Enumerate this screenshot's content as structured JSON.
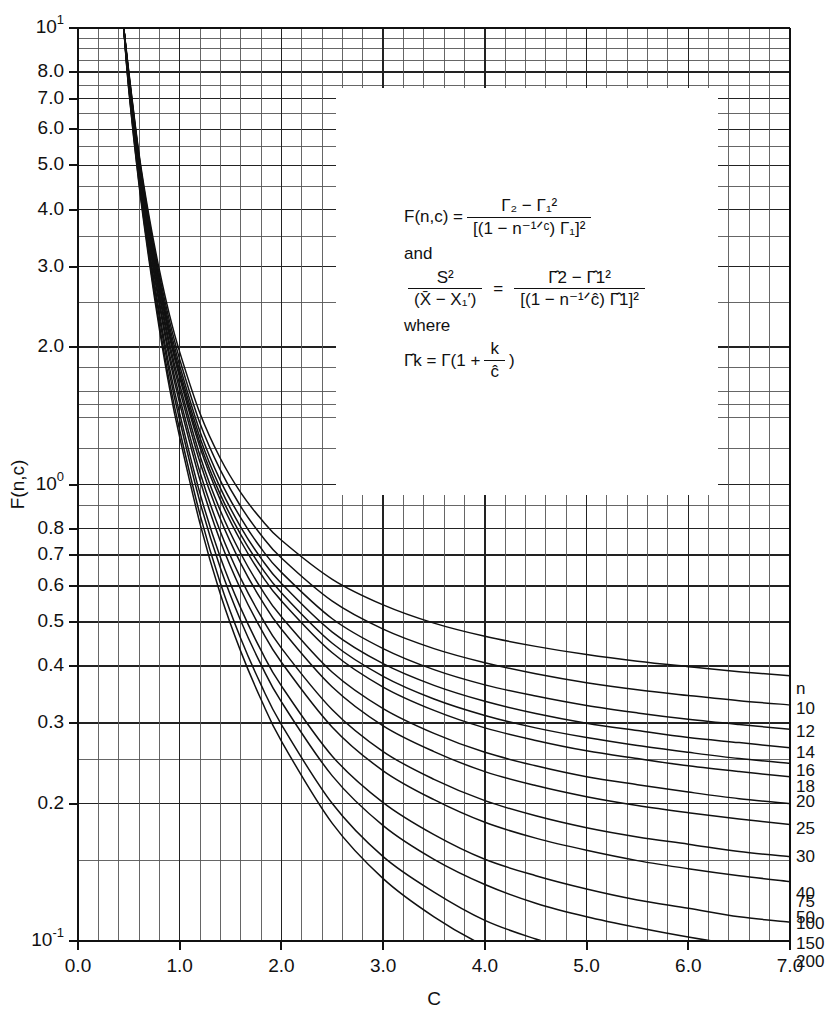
{
  "chart_data": {
    "type": "line",
    "title": "",
    "xlabel": "C",
    "ylabel": "F(n,c)",
    "xlim": [
      0.0,
      7.0
    ],
    "ylim": [
      0.1,
      10.0
    ],
    "yscale": "log",
    "xscale": "linear",
    "grid": true,
    "legend_position": "right-edge-labels",
    "xticks": [
      "0.0",
      "1.0",
      "2.0",
      "3.0",
      "4.0",
      "5.0",
      "6.0",
      "7.0"
    ],
    "xtick_values": [
      0,
      1,
      2,
      3,
      4,
      5,
      6,
      7
    ],
    "yticks": [
      "10¹",
      "8.0",
      "7.0",
      "6.0",
      "5.0",
      "4.0",
      "3.0",
      "2.0",
      "10⁰",
      "0.8",
      "0.7",
      "0.6",
      "0.5",
      "0.4",
      "0.3",
      "0.2",
      "10⁻¹"
    ],
    "ytick_values": [
      10,
      8,
      7,
      6,
      5,
      4,
      3,
      2,
      1,
      0.8,
      0.7,
      0.6,
      0.5,
      0.4,
      0.3,
      0.2,
      0.1
    ],
    "series_header": "n",
    "series": [
      {
        "name": "10",
        "end_value": 0.375,
        "x": [
          0.45,
          0.5,
          0.6,
          0.7,
          0.8,
          0.9,
          1.0,
          1.2,
          1.4,
          1.6,
          1.8,
          2.0,
          2.5,
          3.0,
          3.5,
          4.0,
          4.5,
          5.0,
          5.5,
          6.0,
          6.5,
          7.0
        ],
        "values": [
          10.0,
          8.0,
          5.3,
          3.85,
          2.95,
          2.35,
          1.95,
          1.43,
          1.14,
          0.96,
          0.84,
          0.755,
          0.62,
          0.545,
          0.497,
          0.465,
          0.442,
          0.424,
          0.41,
          0.399,
          0.389,
          0.381
        ]
      },
      {
        "name": "12",
        "end_value": 0.315,
        "x": [
          0.45,
          0.5,
          0.6,
          0.7,
          0.8,
          0.9,
          1.0,
          1.2,
          1.4,
          1.6,
          1.8,
          2.0,
          2.5,
          3.0,
          3.5,
          4.0,
          4.5,
          5.0,
          5.5,
          6.0,
          6.5,
          7.0
        ],
        "values": [
          10.0,
          7.95,
          5.25,
          3.78,
          2.88,
          2.28,
          1.88,
          1.36,
          1.075,
          0.895,
          0.775,
          0.69,
          0.555,
          0.482,
          0.437,
          0.407,
          0.385,
          0.368,
          0.355,
          0.345,
          0.336,
          0.329
        ]
      },
      {
        "name": "14",
        "end_value": 0.283,
        "x": [
          0.45,
          0.5,
          0.6,
          0.7,
          0.8,
          0.9,
          1.0,
          1.2,
          1.4,
          1.6,
          1.8,
          2.0,
          2.5,
          3.0,
          3.5,
          4.0,
          4.5,
          5.0,
          5.5,
          6.0,
          6.5,
          7.0
        ],
        "values": [
          10.0,
          7.9,
          5.2,
          3.72,
          2.82,
          2.22,
          1.82,
          1.305,
          1.02,
          0.845,
          0.725,
          0.642,
          0.508,
          0.437,
          0.393,
          0.364,
          0.344,
          0.328,
          0.316,
          0.306,
          0.298,
          0.291
        ]
      },
      {
        "name": "16",
        "end_value": 0.262,
        "x": [
          0.45,
          0.5,
          0.6,
          0.7,
          0.8,
          0.9,
          1.0,
          1.2,
          1.4,
          1.6,
          1.8,
          2.0,
          2.5,
          3.0,
          3.5,
          4.0,
          4.5,
          5.0,
          5.5,
          6.0,
          6.5,
          7.0
        ],
        "values": [
          10.0,
          7.86,
          5.16,
          3.68,
          2.77,
          2.17,
          1.775,
          1.265,
          0.982,
          0.807,
          0.689,
          0.607,
          0.475,
          0.405,
          0.363,
          0.335,
          0.315,
          0.3,
          0.289,
          0.279,
          0.272,
          0.265
        ]
      },
      {
        "name": "18",
        "end_value": 0.245,
        "x": [
          0.45,
          0.5,
          0.6,
          0.7,
          0.8,
          0.9,
          1.0,
          1.2,
          1.4,
          1.6,
          1.8,
          2.0,
          2.5,
          3.0,
          3.5,
          4.0,
          4.5,
          5.0,
          5.5,
          6.0,
          6.5,
          7.0
        ],
        "values": [
          10.0,
          7.83,
          5.12,
          3.64,
          2.73,
          2.13,
          1.74,
          1.232,
          0.95,
          0.777,
          0.66,
          0.579,
          0.449,
          0.38,
          0.339,
          0.312,
          0.293,
          0.279,
          0.268,
          0.259,
          0.251,
          0.245
        ]
      },
      {
        "name": "20",
        "end_value": 0.232,
        "x": [
          0.45,
          0.5,
          0.6,
          0.7,
          0.8,
          0.9,
          1.0,
          1.2,
          1.4,
          1.6,
          1.8,
          2.0,
          2.5,
          3.0,
          3.5,
          4.0,
          4.5,
          5.0,
          5.5,
          6.0,
          6.5,
          7.0
        ],
        "values": [
          10.0,
          7.8,
          5.09,
          3.61,
          2.7,
          2.1,
          1.712,
          1.205,
          0.924,
          0.752,
          0.636,
          0.556,
          0.428,
          0.36,
          0.32,
          0.293,
          0.275,
          0.261,
          0.251,
          0.242,
          0.235,
          0.229
        ]
      },
      {
        "name": "25",
        "end_value": 0.205,
        "x": [
          0.45,
          0.5,
          0.6,
          0.7,
          0.8,
          0.9,
          1.0,
          1.2,
          1.4,
          1.6,
          1.8,
          2.0,
          2.5,
          3.0,
          3.5,
          4.0,
          4.5,
          5.0,
          5.5,
          6.0,
          6.5,
          7.0
        ],
        "values": [
          10.0,
          7.74,
          5.03,
          3.55,
          2.64,
          2.04,
          1.655,
          1.155,
          0.876,
          0.706,
          0.592,
          0.513,
          0.388,
          0.323,
          0.285,
          0.259,
          0.242,
          0.229,
          0.22,
          0.212,
          0.205,
          0.2
        ]
      },
      {
        "name": "30",
        "end_value": 0.186,
        "x": [
          0.45,
          0.5,
          0.6,
          0.7,
          0.8,
          0.9,
          1.0,
          1.2,
          1.4,
          1.6,
          1.8,
          2.0,
          2.5,
          3.0,
          3.5,
          4.0,
          4.5,
          5.0,
          5.5,
          6.0,
          6.5,
          7.0
        ],
        "values": [
          10.0,
          7.69,
          4.98,
          3.5,
          2.59,
          1.995,
          1.612,
          1.117,
          0.84,
          0.672,
          0.56,
          0.482,
          0.36,
          0.296,
          0.26,
          0.235,
          0.219,
          0.207,
          0.198,
          0.191,
          0.185,
          0.18
        ]
      },
      {
        "name": "40",
        "end_value": 0.159,
        "x": [
          0.45,
          0.5,
          0.6,
          0.7,
          0.8,
          0.9,
          1.0,
          1.2,
          1.4,
          1.6,
          1.8,
          2.0,
          2.5,
          3.0,
          3.5,
          4.0,
          4.5,
          5.0,
          5.5,
          6.0,
          6.5,
          7.0
        ],
        "values": [
          10.0,
          7.62,
          4.9,
          3.43,
          2.52,
          1.93,
          1.55,
          1.062,
          0.788,
          0.623,
          0.514,
          0.438,
          0.321,
          0.26,
          0.226,
          0.203,
          0.188,
          0.177,
          0.169,
          0.163,
          0.157,
          0.153
        ]
      },
      {
        "name": "50",
        "end_value": 0.141,
        "x": [
          0.45,
          0.5,
          0.6,
          0.7,
          0.8,
          0.9,
          1.0,
          1.2,
          1.4,
          1.6,
          1.8,
          2.0,
          2.5,
          3.0,
          3.5,
          4.0,
          4.5,
          5.0,
          5.5,
          6.0,
          6.5,
          7.0
        ],
        "values": [
          10.0,
          7.57,
          4.84,
          3.37,
          2.47,
          1.882,
          1.505,
          1.022,
          0.751,
          0.589,
          0.482,
          0.408,
          0.294,
          0.236,
          0.204,
          0.182,
          0.168,
          0.158,
          0.15,
          0.144,
          0.139,
          0.135
        ]
      },
      {
        "name": "75",
        "end_value": 0.116,
        "x": [
          0.45,
          0.5,
          0.6,
          0.7,
          0.8,
          0.9,
          1.0,
          1.2,
          1.4,
          1.6,
          1.8,
          2.0,
          2.5,
          3.0,
          3.5,
          4.0,
          4.5,
          5.0,
          5.5,
          6.0,
          6.5,
          7.0
        ],
        "values": [
          10.0,
          7.48,
          4.74,
          3.28,
          2.38,
          1.8,
          1.43,
          0.955,
          0.692,
          0.536,
          0.433,
          0.362,
          0.254,
          0.201,
          0.171,
          0.151,
          0.139,
          0.13,
          0.123,
          0.118,
          0.113,
          0.11
        ]
      },
      {
        "name": "100",
        "end_value": 0.101,
        "x": [
          0.45,
          0.5,
          0.6,
          0.7,
          0.8,
          0.9,
          1.0,
          1.2,
          1.4,
          1.6,
          1.8,
          2.0,
          2.5,
          3.0,
          3.5,
          4.0,
          4.5,
          5.0,
          5.5,
          6.0,
          6.5,
          7.0
        ],
        "values": [
          10.0,
          7.42,
          4.68,
          3.22,
          2.32,
          1.748,
          1.382,
          0.914,
          0.656,
          0.503,
          0.403,
          0.334,
          0.23,
          0.179,
          0.151,
          0.133,
          0.121,
          0.113,
          0.107,
          0.102,
          0.098,
          0.0952
        ]
      },
      {
        "name": "150",
        "end_value": 0.1,
        "x": [
          0.45,
          0.5,
          0.6,
          0.7,
          0.8,
          0.9,
          1.0,
          1.2,
          1.4,
          1.6,
          1.8,
          2.0,
          2.5,
          3.0,
          3.5,
          4.0,
          4.5,
          5.0,
          5.5,
          6.0,
          6.5,
          7.0
        ],
        "values": [
          10.0,
          7.34,
          4.59,
          3.14,
          2.24,
          1.676,
          1.315,
          0.858,
          0.608,
          0.46,
          0.364,
          0.298,
          0.2,
          0.153,
          0.128,
          0.111,
          0.101,
          0.0936,
          0.0882,
          0.084,
          0.0806,
          0.0782
        ]
      },
      {
        "name": "200",
        "end_value": 0.1,
        "x": [
          0.45,
          0.5,
          0.6,
          0.7,
          0.8,
          0.9,
          1.0,
          1.2,
          1.4,
          1.6,
          1.8,
          2.0,
          2.5,
          3.0,
          3.5,
          4.0,
          4.5,
          5.0,
          5.5,
          6.0,
          6.5,
          7.0
        ],
        "values": [
          10.0,
          7.29,
          4.53,
          3.08,
          2.19,
          1.626,
          1.268,
          0.82,
          0.575,
          0.431,
          0.338,
          0.274,
          0.181,
          0.137,
          0.113,
          0.0975,
          0.088,
          0.0813,
          0.0763,
          0.0724,
          0.0693,
          0.0671
        ]
      }
    ]
  },
  "formula": {
    "lhs1": "F(n,c) =",
    "f1_num": "Γ₂ − Γ₁²",
    "f1_den": "[(1 − n⁻¹ᐟᶜ) Γ₁]²",
    "and": "and",
    "f2_lhs_num": "S²",
    "f2_lhs_den": "(X̄ − X₁′)",
    "f2_eq": "=",
    "f2_num": "Γ̂2 − Γ̂1²",
    "f2_den": "[(1 − n⁻¹ᐟĉ) Γ̂1]²",
    "where": "where",
    "f3_lhs": "Γ̂k = Γ(1 +",
    "f3_num": "k",
    "f3_den": "ĉ",
    "f3_close": ")"
  },
  "colors": {
    "ink": "#111111",
    "grid_major": "#222222",
    "grid_minor": "#555555",
    "curve": "#111111",
    "background": "#ffffff"
  }
}
